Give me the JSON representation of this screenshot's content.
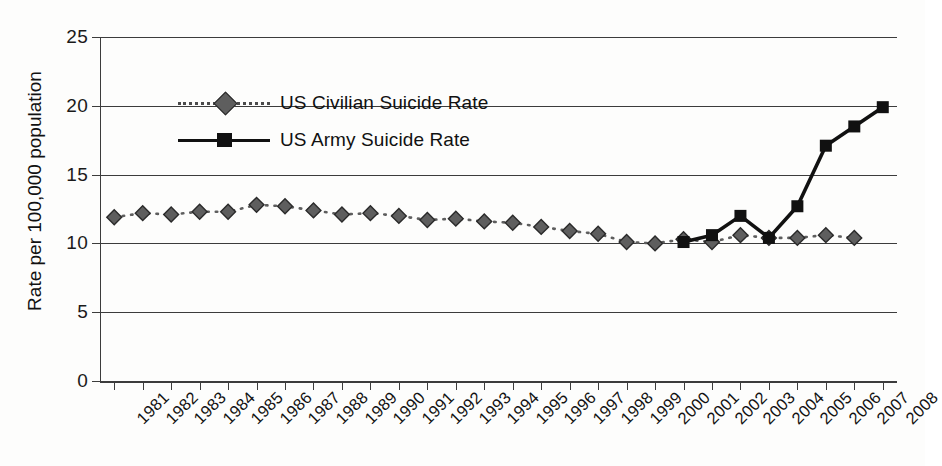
{
  "chart_data": {
    "type": "line",
    "title": "",
    "xlabel": "",
    "ylabel": "Rate per 100,000 population",
    "ylim": [
      0,
      25
    ],
    "yticks": [
      0,
      5,
      10,
      15,
      20,
      25
    ],
    "grid": true,
    "legend_position": "inside-top-left",
    "categories": [
      "1981",
      "1982",
      "1983",
      "1984",
      "1985",
      "1986",
      "1987",
      "1988",
      "1989",
      "1990",
      "1991",
      "1992",
      "1993",
      "1994",
      "1995",
      "1996",
      "1997",
      "1998",
      "1999",
      "2000",
      "2001",
      "2002",
      "2003",
      "2004",
      "2005",
      "2006",
      "2007",
      "2008"
    ],
    "series": [
      {
        "name": "US Civilian Suicide Rate",
        "marker": "diamond",
        "linestyle": "dotted",
        "color": "#5e5e5e",
        "values": [
          11.9,
          12.2,
          12.1,
          12.3,
          12.3,
          12.8,
          12.7,
          12.4,
          12.1,
          12.2,
          12.0,
          11.7,
          11.8,
          11.6,
          11.5,
          11.2,
          10.9,
          10.7,
          10.1,
          10.0,
          10.3,
          10.1,
          10.6,
          10.4,
          10.4,
          10.6,
          10.4,
          null
        ]
      },
      {
        "name": "US Army Suicide Rate",
        "marker": "square",
        "linestyle": "solid",
        "color": "#111111",
        "values": [
          null,
          null,
          null,
          null,
          null,
          null,
          null,
          null,
          null,
          null,
          null,
          null,
          null,
          null,
          null,
          null,
          null,
          null,
          null,
          null,
          10.1,
          10.6,
          12.0,
          10.4,
          12.7,
          17.1,
          18.5,
          19.9
        ]
      }
    ]
  },
  "legend": {
    "items": [
      {
        "label": "US Civilian Suicide Rate",
        "style": "dotted",
        "marker": "diamond"
      },
      {
        "label": "US Army Suicide Rate",
        "style": "solid",
        "marker": "square"
      }
    ]
  },
  "axes": {
    "y_title": "Rate per 100,000 population",
    "y_tick_labels": [
      "0",
      "5",
      "10",
      "15",
      "20",
      "25"
    ],
    "x_tick_labels": [
      "1981",
      "1982",
      "1983",
      "1984",
      "1985",
      "1986",
      "1987",
      "1988",
      "1989",
      "1990",
      "1991",
      "1992",
      "1993",
      "1994",
      "1995",
      "1996",
      "1997",
      "1998",
      "1999",
      "2000",
      "2001",
      "2002",
      "2003",
      "2004",
      "2005",
      "2006",
      "2007",
      "2008"
    ]
  },
  "colors": {
    "axis": "#3c3c3c",
    "grid": "#3c3c3c",
    "civilian": "#5e5e5e",
    "army": "#111111",
    "background": "#fdfdfc"
  }
}
